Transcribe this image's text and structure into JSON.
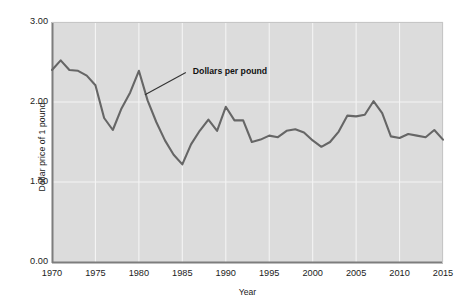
{
  "chart_data": {
    "type": "line",
    "title": "",
    "xlabel": "Year",
    "ylabel": "Dollar price of 1 pound",
    "xlim": [
      1970,
      2015
    ],
    "ylim": [
      0.0,
      3.0
    ],
    "grid": true,
    "legend_position": "none",
    "series_color": "#666666",
    "plot_background": "#dcdcdc",
    "annotations": [
      {
        "text": "Dollars per pound",
        "x": 1980.8,
        "y": 2.09,
        "leader_from_x": 1980.7,
        "leader_from_y": 2.09,
        "leader_to_x": 1985.4,
        "leader_to_y": 2.37
      }
    ],
    "ytick_labels": [
      "0.00",
      "1.00",
      "2.00",
      "3.00"
    ],
    "ytick_values": [
      0.0,
      1.0,
      2.0,
      3.0
    ],
    "xtick_labels": [
      "1970",
      "1975",
      "1980",
      "1985",
      "1990",
      "1995",
      "2000",
      "2005",
      "2010",
      "2015"
    ],
    "xtick_values": [
      1970,
      1975,
      1980,
      1985,
      1990,
      1995,
      2000,
      2005,
      2010,
      2015
    ],
    "x": [
      1970,
      1971,
      1972,
      1973,
      1974,
      1975,
      1976,
      1977,
      1978,
      1979,
      1980,
      1981,
      1982,
      1983,
      1984,
      1985,
      1986,
      1987,
      1988,
      1989,
      1990,
      1991,
      1992,
      1993,
      1994,
      1995,
      1996,
      1997,
      1998,
      1999,
      2000,
      2001,
      2002,
      2003,
      2004,
      2005,
      2006,
      2007,
      2008,
      2009,
      2010,
      2011,
      2012,
      2013,
      2014,
      2015
    ],
    "values": [
      2.4,
      2.52,
      2.4,
      2.39,
      2.33,
      2.21,
      1.8,
      1.65,
      1.92,
      2.12,
      2.39,
      2.02,
      1.75,
      1.52,
      1.34,
      1.22,
      1.47,
      1.64,
      1.78,
      1.64,
      1.94,
      1.77,
      1.77,
      1.5,
      1.53,
      1.58,
      1.56,
      1.64,
      1.66,
      1.62,
      1.52,
      1.44,
      1.5,
      1.63,
      1.83,
      1.82,
      1.84,
      2.01,
      1.86,
      1.57,
      1.55,
      1.6,
      1.58,
      1.56,
      1.65,
      1.53
    ],
    "series": [
      {
        "name": "Dollars per pound",
        "values": [
          2.4,
          2.52,
          2.4,
          2.39,
          2.33,
          2.21,
          1.8,
          1.65,
          1.92,
          2.12,
          2.39,
          2.02,
          1.75,
          1.52,
          1.34,
          1.22,
          1.47,
          1.64,
          1.78,
          1.64,
          1.94,
          1.77,
          1.77,
          1.5,
          1.53,
          1.58,
          1.56,
          1.64,
          1.66,
          1.62,
          1.52,
          1.44,
          1.5,
          1.63,
          1.83,
          1.82,
          1.84,
          2.01,
          1.86,
          1.57,
          1.55,
          1.6,
          1.58,
          1.56,
          1.65,
          1.53
        ]
      }
    ]
  }
}
